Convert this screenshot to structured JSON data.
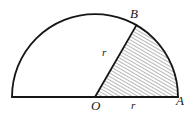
{
  "figure": {
    "name": "semicircle-with-shaded-sector",
    "background_color": "#ffffff",
    "stroke_color": "#161616",
    "hatch_color": "#4a4a4a",
    "labels": {
      "point_b": "B",
      "point_o": "O",
      "point_a": "A",
      "radius_ob": "r",
      "radius_oa": "r"
    }
  },
  "geometry": {
    "center": {
      "x": 95,
      "y": 97
    },
    "radius": 83,
    "diameter_left_x": 12,
    "diameter_right_x": 178,
    "baseline_y": 97,
    "point_a": {
      "x": 178,
      "y": 97
    },
    "point_b": {
      "x": 130,
      "y": 25
    },
    "sector_angle_degrees": 60,
    "semicircle_angle_degrees": 180,
    "hatch_angle_degrees": 60,
    "hatch_spacing_px": 3,
    "stroke_width_outline": 1.8,
    "stroke_width_radius": 1.8,
    "stroke_width_hatch": 0.7
  }
}
